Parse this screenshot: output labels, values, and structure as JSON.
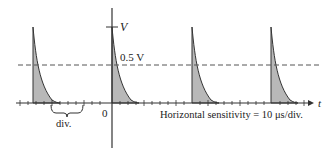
{
  "diagram": {
    "type": "oscilloscope-waveform",
    "labels": {
      "v_axis": "V",
      "t_axis": "t",
      "origin": "0",
      "threshold": "0.5 V",
      "division": "div.",
      "sensitivity": "Horizontal sensitivity = 10 μs/div."
    },
    "pulse_count": 4,
    "colors": {
      "line": "#333333",
      "fill": "#b8b8b8",
      "dashed": "#555555"
    }
  }
}
